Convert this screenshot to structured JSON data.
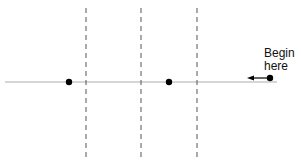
{
  "diagram": {
    "label_line1": "Begin",
    "label_line2": "here",
    "baseline": {
      "y": 82,
      "x1": 5,
      "x2": 277,
      "color": "#c8c8c8"
    },
    "dividers_x": [
      86,
      141,
      197
    ],
    "dots": [
      {
        "x": 69,
        "y": 82
      },
      {
        "x": 169,
        "y": 82
      },
      {
        "x": 270,
        "y": 78
      }
    ],
    "arrow": {
      "from_x": 268,
      "to_x": 248,
      "y": 78,
      "direction": "left"
    }
  }
}
